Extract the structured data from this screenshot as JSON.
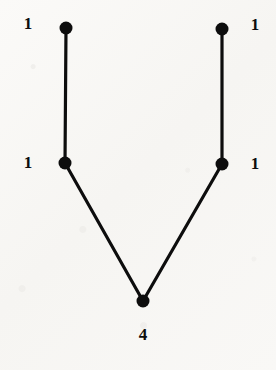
{
  "figure": {
    "type": "graph-diagram",
    "background_color": "#f8f7f5",
    "ink_color": "#0d0d0d",
    "node_radius": 6.5,
    "edge_width": 3.2,
    "nodes": [
      {
        "id": "top-left",
        "name": "node-top-left",
        "x": 66,
        "y": 28,
        "label": "1",
        "label_x": 28,
        "label_y": 23
      },
      {
        "id": "top-right",
        "name": "node-top-right",
        "x": 222,
        "y": 29,
        "label": "1",
        "label_x": 255,
        "label_y": 24
      },
      {
        "id": "middle-left",
        "name": "node-middle-left",
        "x": 65,
        "y": 163,
        "label": "1",
        "label_x": 28,
        "label_y": 162
      },
      {
        "id": "middle-right",
        "name": "node-middle-right",
        "x": 222,
        "y": 164,
        "label": "1",
        "label_x": 255,
        "label_y": 163
      },
      {
        "id": "bottom",
        "name": "node-bottom",
        "x": 143,
        "y": 301,
        "label": "4",
        "label_x": 143,
        "label_y": 334
      }
    ],
    "edges": [
      {
        "name": "edge-top-left-to-middle-left",
        "from": "top-left",
        "to": "middle-left"
      },
      {
        "name": "edge-top-right-to-middle-right",
        "from": "top-right",
        "to": "middle-right"
      },
      {
        "name": "edge-middle-left-to-bottom",
        "from": "middle-left",
        "to": "bottom"
      },
      {
        "name": "edge-middle-right-to-bottom",
        "from": "middle-right",
        "to": "bottom"
      }
    ],
    "labels": [
      "1",
      "1",
      "1",
      "1",
      "4"
    ]
  }
}
